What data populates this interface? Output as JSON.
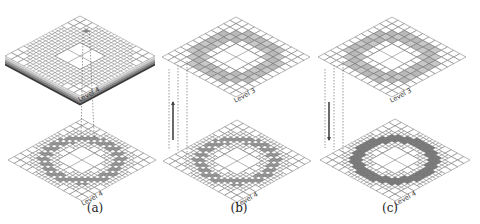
{
  "colors": {
    "grid_line": "#6b6b6b",
    "fill_light": "#b9b9b9",
    "fill_dark": "#7a7a7a",
    "fill_medium": "#9a9a9a",
    "background": "#ffffff",
    "dashed": "#555555",
    "arrow": "#444444"
  },
  "panels": [
    {
      "id": "a",
      "caption": "(a)",
      "top_label": "Level 4",
      "bottom_label": "Level 4",
      "arrow": "none",
      "top_kind": "stacked-adaptive",
      "bottom_kind": "ring-fine-light"
    },
    {
      "id": "b",
      "caption": "(b)",
      "top_label": "Level 3",
      "bottom_label": "Level 4",
      "arrow": "up",
      "top_kind": "ring-coarse",
      "bottom_kind": "ring-fine-light"
    },
    {
      "id": "c",
      "caption": "(c)",
      "top_label": "Level 3",
      "bottom_label": "Level 4",
      "arrow": "down",
      "top_kind": "ring-coarse",
      "bottom_kind": "ring-fine-dark"
    }
  ]
}
